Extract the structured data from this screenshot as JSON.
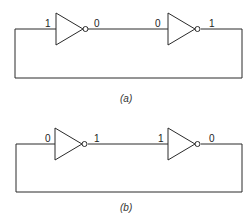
{
  "diagram": {
    "circuits": [
      {
        "id": "a",
        "caption": "(a)",
        "labels": {
          "gate1_input": "1",
          "gate1_output": "0",
          "gate2_input": "0",
          "gate2_output": "1"
        }
      },
      {
        "id": "b",
        "caption": "(b)",
        "labels": {
          "gate1_input": "0",
          "gate1_output": "1",
          "gate2_input": "1",
          "gate2_output": "0"
        }
      }
    ],
    "colors": {
      "line": "#2a2a2a",
      "background": "#ffffff"
    }
  }
}
